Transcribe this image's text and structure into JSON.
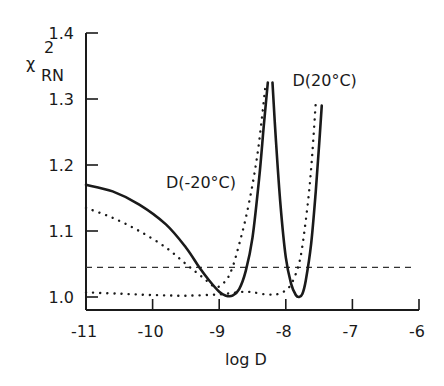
{
  "chart_data": {
    "type": "line",
    "title": "",
    "xlabel": "log D",
    "ylabel": "χ²_RN",
    "ylabel_main": "χ",
    "ylabel_sup": "2",
    "ylabel_sub": "RN",
    "xlim": [
      -11,
      -6
    ],
    "ylim": [
      0.98,
      1.4
    ],
    "x_ticks": [
      -11,
      -10,
      -9,
      -8,
      -7,
      -6
    ],
    "x_tick_labels": [
      "-11",
      "-10",
      "-9",
      "-8",
      "-7",
      "-6"
    ],
    "y_ticks": [
      1.0,
      1.1,
      1.2,
      1.3,
      1.4
    ],
    "y_tick_labels": [
      "1.0",
      "1.1",
      "1.2",
      "1.3",
      "1.4"
    ],
    "grid": false,
    "legend": null,
    "annotations": [
      {
        "text": "D(-20°C)",
        "x": -9.8,
        "y": 1.165
      },
      {
        "text": "D(20°C)",
        "x": -7.9,
        "y": 1.32
      }
    ],
    "reference_line": {
      "style": "dashed",
      "y": 1.045,
      "x_range": [
        -11,
        -6.05
      ]
    },
    "series": [
      {
        "name": "D(-20°C) solid",
        "style": "solid",
        "x": [
          -11.0,
          -10.6,
          -10.2,
          -9.8,
          -9.5,
          -9.3,
          -9.15,
          -9.0,
          -8.9,
          -8.8,
          -8.7,
          -8.6,
          -8.5,
          -8.4,
          -8.33,
          -8.27
        ],
        "y": [
          1.17,
          1.16,
          1.14,
          1.11,
          1.075,
          1.045,
          1.025,
          1.008,
          1.002,
          1.002,
          1.012,
          1.04,
          1.09,
          1.18,
          1.26,
          1.325
        ]
      },
      {
        "name": "D(20°C) solid",
        "style": "solid",
        "x": [
          -8.2,
          -8.15,
          -8.08,
          -8.0,
          -7.92,
          -7.85,
          -7.8,
          -7.75,
          -7.7,
          -7.62,
          -7.55,
          -7.5,
          -7.46
        ],
        "y": [
          1.325,
          1.24,
          1.14,
          1.06,
          1.02,
          1.003,
          1.0,
          1.005,
          1.025,
          1.08,
          1.16,
          1.23,
          1.29
        ]
      },
      {
        "name": "D(-20°C) dotted",
        "style": "dotted",
        "x": [
          -11.0,
          -10.6,
          -10.2,
          -9.8,
          -9.5,
          -9.25,
          -9.05,
          -8.9,
          -8.8,
          -8.7,
          -8.6,
          -8.5,
          -8.42,
          -8.36,
          -8.3
        ],
        "y": [
          1.135,
          1.12,
          1.1,
          1.075,
          1.05,
          1.03,
          1.015,
          1.025,
          1.045,
          1.08,
          1.12,
          1.17,
          1.22,
          1.27,
          1.325
        ]
      },
      {
        "name": "D(20°C) dotted",
        "style": "dotted",
        "x": [
          -11.0,
          -10.5,
          -10.0,
          -9.5,
          -9.0,
          -8.6,
          -8.3,
          -8.1,
          -7.95,
          -7.85,
          -7.78,
          -7.72,
          -7.65,
          -7.6,
          -7.55
        ],
        "y": [
          1.007,
          1.005,
          1.003,
          1.002,
          1.004,
          1.008,
          1.004,
          1.005,
          1.015,
          1.035,
          1.06,
          1.1,
          1.16,
          1.22,
          1.295
        ]
      }
    ]
  }
}
